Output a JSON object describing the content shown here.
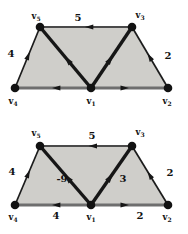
{
  "figure": {
    "background": "#ffffff",
    "region_fill": "#cfceca",
    "vertex_color": "#121212",
    "edge_color": "#161616",
    "label_color": "#111111",
    "vertex_radius": 4.3
  },
  "diagrams": [
    {
      "id": "weighted-graph-top",
      "fill_polygon": [
        "v4",
        "v5",
        "v3",
        "v2"
      ],
      "vertices": [
        {
          "id": "v5",
          "base": "v",
          "sub": "5",
          "x": 40,
          "y": 27,
          "lx": 36,
          "ly": 19
        },
        {
          "id": "v3",
          "base": "v",
          "sub": "3",
          "x": 132,
          "y": 27,
          "lx": 140,
          "ly": 18
        },
        {
          "id": "v4",
          "base": "v",
          "sub": "4",
          "x": 15,
          "y": 88,
          "lx": 13,
          "ly": 104
        },
        {
          "id": "v1",
          "base": "v",
          "sub": "1",
          "x": 91,
          "y": 88,
          "lx": 91,
          "ly": 104
        },
        {
          "id": "v2",
          "base": "v",
          "sub": "2",
          "x": 168,
          "y": 88,
          "lx": 167,
          "ly": 104
        }
      ],
      "edges": [
        {
          "from": "v3",
          "to": "v5",
          "weight": "5",
          "wx": 78,
          "wy": 21,
          "width": 2.2,
          "color": "#4a4a4a",
          "t": 0.46,
          "asize": 4
        },
        {
          "from": "v4",
          "to": "v5",
          "weight": "4",
          "wx": 11,
          "wy": 57,
          "width": 1.7,
          "color": "#1c1c1c",
          "t": 0.52,
          "asize": 4
        },
        {
          "from": "v2",
          "to": "v3",
          "weight": "2",
          "wx": 168,
          "wy": 59,
          "width": 1.7,
          "color": "#1c1c1c",
          "t": 0.5,
          "asize": 4
        },
        {
          "from": "v1",
          "to": "v4",
          "weight": "",
          "wx": 0,
          "wy": 0,
          "width": 2.8,
          "color": "#6e6e6e",
          "t": 0.45,
          "asize": 4
        },
        {
          "from": "v1",
          "to": "v2",
          "weight": "",
          "wx": 0,
          "wy": 0,
          "width": 2.8,
          "color": "#6e6e6e",
          "t": 0.43,
          "asize": 4
        },
        {
          "from": "v1",
          "to": "v5",
          "weight": "",
          "wx": 0,
          "wy": 0,
          "width": 3.4,
          "color": "#161616",
          "t": 0.45,
          "asize": 4.6
        },
        {
          "from": "v1",
          "to": "v3",
          "weight": "",
          "wx": 0,
          "wy": 0,
          "width": 3.4,
          "color": "#161616",
          "t": 0.46,
          "asize": 4.6
        }
      ]
    },
    {
      "id": "weighted-graph-bottom",
      "fill_polygon": [
        "v4",
        "v5",
        "v3",
        "v2"
      ],
      "vertices": [
        {
          "id": "v5",
          "base": "v",
          "sub": "5",
          "x": 40,
          "y": 29,
          "lx": 36,
          "ly": 19
        },
        {
          "id": "v3",
          "base": "v",
          "sub": "3",
          "x": 132,
          "y": 29,
          "lx": 140,
          "ly": 18
        },
        {
          "id": "v4",
          "base": "v",
          "sub": "4",
          "x": 15,
          "y": 88,
          "lx": 13,
          "ly": 103
        },
        {
          "id": "v1",
          "base": "v",
          "sub": "1",
          "x": 91,
          "y": 88,
          "lx": 91,
          "ly": 103
        },
        {
          "id": "v2",
          "base": "v",
          "sub": "2",
          "x": 168,
          "y": 88,
          "lx": 167,
          "ly": 103
        }
      ],
      "edges": [
        {
          "from": "v3",
          "to": "v5",
          "weight": "5",
          "wx": 92,
          "wy": 22,
          "width": 2.2,
          "color": "#4a4a4a",
          "t": 0.42,
          "asize": 4
        },
        {
          "from": "v4",
          "to": "v5",
          "weight": "4",
          "wx": 12,
          "wy": 58,
          "width": 1.7,
          "color": "#1c1c1c",
          "t": 0.52,
          "asize": 4
        },
        {
          "from": "v2",
          "to": "v3",
          "weight": "2",
          "wx": 170,
          "wy": 59,
          "width": 1.7,
          "color": "#1c1c1c",
          "t": 0.5,
          "asize": 4
        },
        {
          "from": "v1",
          "to": "v4",
          "weight": "4",
          "wx": 56,
          "wy": 102,
          "width": 2.8,
          "color": "#6e6e6e",
          "t": 0.45,
          "asize": 4
        },
        {
          "from": "v1",
          "to": "v2",
          "weight": "2",
          "wx": 140,
          "wy": 102,
          "width": 2.8,
          "color": "#6e6e6e",
          "t": 0.43,
          "asize": 4
        },
        {
          "from": "v1",
          "to": "v5",
          "weight": "-9",
          "wx": 62,
          "wy": 65,
          "width": 3.4,
          "color": "#161616",
          "t": 0.45,
          "asize": 4.6
        },
        {
          "from": "v1",
          "to": "v3",
          "weight": "3",
          "wx": 123,
          "wy": 65,
          "width": 3.4,
          "color": "#161616",
          "t": 0.46,
          "asize": 4.6
        }
      ]
    }
  ]
}
